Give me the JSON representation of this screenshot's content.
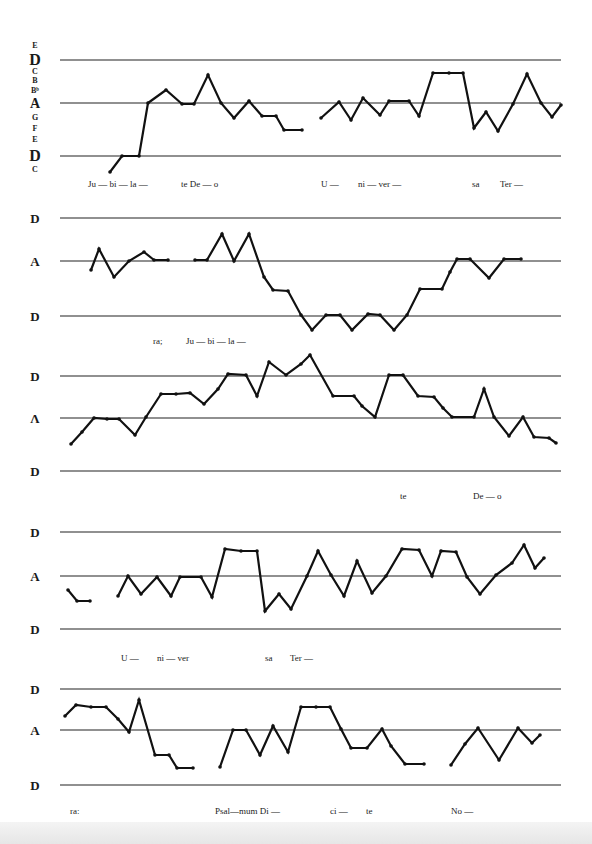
{
  "chart_data": {
    "type": "line",
    "title": "",
    "pitch_scale_labels": [
      "E",
      "D",
      "C",
      "B",
      "B♭",
      "A",
      "G",
      "F",
      "E",
      "D",
      "C"
    ],
    "ylabel_ticks": [
      "D",
      "A",
      "D"
    ],
    "systems": [
      {
        "lines_y": [
          60,
          103,
          156
        ],
        "labels": [
          {
            "text": "E",
            "x": 35,
            "y": 48,
            "size": 8
          },
          {
            "text": "D",
            "x": 35,
            "y": 65,
            "size": 16
          },
          {
            "text": "C",
            "x": 35,
            "y": 74,
            "size": 8
          },
          {
            "text": "B",
            "x": 35,
            "y": 83,
            "size": 8
          },
          {
            "text": "Bᵇ",
            "x": 35,
            "y": 93,
            "size": 8
          },
          {
            "text": "A",
            "x": 35,
            "y": 108,
            "size": 14
          },
          {
            "text": "G",
            "x": 35,
            "y": 120,
            "size": 8
          },
          {
            "text": "F",
            "x": 35,
            "y": 131,
            "size": 8
          },
          {
            "text": "E",
            "x": 35,
            "y": 142,
            "size": 8
          },
          {
            "text": "D",
            "x": 35,
            "y": 161,
            "size": 16
          },
          {
            "text": "C",
            "x": 35,
            "y": 172,
            "size": 8
          }
        ],
        "segments": [
          [
            [
              110,
              172
            ],
            [
              122,
              156
            ],
            [
              139,
              156
            ],
            [
              148,
              103
            ],
            [
              166,
              90
            ],
            [
              182,
              104
            ],
            [
              194,
              104
            ],
            [
              208,
              75
            ],
            [
              221,
              103
            ],
            [
              234,
              118
            ],
            [
              249,
              101
            ],
            [
              262,
              116
            ],
            [
              276,
              116
            ],
            [
              284,
              130
            ],
            [
              302,
              130
            ]
          ],
          [
            [
              321,
              118
            ],
            [
              339,
              102
            ],
            [
              351,
              120
            ],
            [
              363,
              98
            ],
            [
              380,
              115
            ],
            [
              389,
              101
            ],
            [
              409,
              101
            ],
            [
              419,
              116
            ],
            [
              433,
              73
            ],
            [
              449,
              73
            ],
            [
              463,
              73
            ],
            [
              474,
              128
            ],
            [
              486,
              112
            ],
            [
              498,
              131
            ],
            [
              513,
              104
            ],
            [
              527,
              74
            ],
            [
              541,
              103
            ],
            [
              552,
              117
            ],
            [
              561,
              105
            ]
          ]
        ],
        "lyrics": [
          {
            "text": "Ju — bi — la —",
            "x": 88,
            "y": 187
          },
          {
            "text": "te De —   o",
            "x": 181,
            "y": 187
          },
          {
            "text": "U —",
            "x": 321,
            "y": 187
          },
          {
            "text": "ni — ver —",
            "x": 358,
            "y": 187
          },
          {
            "text": "sa",
            "x": 472,
            "y": 187
          },
          {
            "text": "Ter —",
            "x": 500,
            "y": 187
          }
        ]
      },
      {
        "lines_y": [
          218,
          261,
          316
        ],
        "labels": [
          {
            "text": "D",
            "x": 35,
            "y": 223,
            "size": 13
          },
          {
            "text": "A",
            "x": 35,
            "y": 266,
            "size": 13
          },
          {
            "text": "D",
            "x": 35,
            "y": 321,
            "size": 13
          }
        ],
        "segments": [
          [
            [
              91,
              270
            ],
            [
              99,
              249
            ],
            [
              114,
              277
            ],
            [
              129,
              261
            ],
            [
              144,
              252
            ],
            [
              154,
              260
            ],
            [
              168,
              260
            ]
          ],
          [
            [
              195,
              260
            ],
            [
              207,
              260
            ],
            [
              222,
              234
            ],
            [
              234,
              261
            ],
            [
              249,
              234
            ],
            [
              264,
              277
            ],
            [
              273,
              290
            ],
            [
              288,
              291
            ],
            [
              301,
              315
            ],
            [
              312,
              330
            ],
            [
              326,
              315
            ],
            [
              340,
              315
            ],
            [
              352,
              330
            ],
            [
              368,
              314
            ],
            [
              380,
              315
            ],
            [
              394,
              330
            ],
            [
              407,
              315
            ],
            [
              420,
              289
            ],
            [
              442,
              289
            ],
            [
              450,
              272
            ],
            [
              457,
              259
            ],
            [
              470,
              259
            ],
            [
              489,
              278
            ],
            [
              504,
              259
            ],
            [
              521,
              259
            ]
          ]
        ],
        "lyrics": [
          {
            "text": "ra;",
            "x": 153,
            "y": 344
          },
          {
            "text": "Ju — bi — la —",
            "x": 186,
            "y": 344
          }
        ]
      },
      {
        "lines_y": [
          376,
          418,
          471
        ],
        "labels": [
          {
            "text": "D",
            "x": 35,
            "y": 381,
            "size": 13
          },
          {
            "text": "Λ",
            "x": 35,
            "y": 423,
            "size": 13
          },
          {
            "text": "D",
            "x": 35,
            "y": 476,
            "size": 13
          }
        ],
        "segments": [
          [
            [
              71,
              444
            ],
            [
              82,
              432
            ],
            [
              94,
              418
            ],
            [
              107,
              419
            ],
            [
              119,
              419
            ],
            [
              135,
              435
            ],
            [
              146,
              417
            ],
            [
              161,
              394
            ],
            [
              176,
              394
            ],
            [
              190,
              393
            ],
            [
              204,
              404
            ],
            [
              218,
              389
            ],
            [
              228,
              374
            ],
            [
              246,
              375
            ],
            [
              257,
              396
            ],
            [
              269,
              362
            ],
            [
              286,
              375
            ],
            [
              301,
              364
            ],
            [
              310,
              355
            ],
            [
              333,
              396
            ],
            [
              354,
              396
            ],
            [
              362,
              406
            ],
            [
              375,
              417
            ],
            [
              389,
              375
            ],
            [
              403,
              375
            ],
            [
              418,
              396
            ],
            [
              434,
              397
            ],
            [
              443,
              408
            ],
            [
              452,
              417
            ],
            [
              474,
              417
            ],
            [
              484,
              389
            ],
            [
              494,
              417
            ],
            [
              509,
              436
            ],
            [
              523,
              417
            ],
            [
              534,
              437
            ],
            [
              549,
              438
            ],
            [
              556,
              443
            ]
          ]
        ],
        "lyrics": [
          {
            "text": "te",
            "x": 400,
            "y": 499
          },
          {
            "text": "De —  o",
            "x": 473,
            "y": 499
          }
        ]
      },
      {
        "lines_y": [
          532,
          576,
          629
        ],
        "labels": [
          {
            "text": "D",
            "x": 35,
            "y": 537,
            "size": 13
          },
          {
            "text": "A",
            "x": 35,
            "y": 581,
            "size": 13
          },
          {
            "text": "D",
            "x": 35,
            "y": 634,
            "size": 13
          }
        ],
        "segments": [
          [
            [
              68,
              590
            ],
            [
              77,
              601
            ],
            [
              90,
              601
            ]
          ],
          [
            [
              118,
              596
            ],
            [
              128,
              576
            ],
            [
              141,
              594
            ],
            [
              157,
              577
            ],
            [
              171,
              596
            ],
            [
              180,
              577
            ],
            [
              201,
              577
            ],
            [
              212,
              597
            ],
            [
              225,
              549
            ],
            [
              241,
              551
            ],
            [
              257,
              551
            ],
            [
              265,
              611
            ],
            [
              279,
              594
            ],
            [
              291,
              609
            ],
            [
              307,
              576
            ],
            [
              318,
              551
            ],
            [
              331,
              575
            ],
            [
              344,
              596
            ],
            [
              357,
              561
            ],
            [
              372,
              593
            ],
            [
              386,
              576
            ],
            [
              402,
              549
            ],
            [
              419,
              550
            ],
            [
              432,
              576
            ],
            [
              441,
              551
            ],
            [
              456,
              552
            ],
            [
              467,
              577
            ],
            [
              480,
              594
            ],
            [
              496,
              575
            ],
            [
              512,
              563
            ],
            [
              524,
              545
            ],
            [
              535,
              568
            ],
            [
              544,
              558
            ]
          ]
        ],
        "lyrics": [
          {
            "text": "U —",
            "x": 121,
            "y": 661
          },
          {
            "text": "ni — ver",
            "x": 157,
            "y": 661
          },
          {
            "text": "sa",
            "x": 265,
            "y": 661
          },
          {
            "text": "Ter —",
            "x": 290,
            "y": 661
          }
        ]
      },
      {
        "lines_y": [
          689,
          730,
          785
        ],
        "labels": [
          {
            "text": "D",
            "x": 35,
            "y": 694,
            "size": 13
          },
          {
            "text": "A",
            "x": 35,
            "y": 735,
            "size": 13
          },
          {
            "text": "D",
            "x": 35,
            "y": 790,
            "size": 13
          }
        ],
        "segments": [
          [
            [
              65,
              716
            ],
            [
              76,
              705
            ],
            [
              91,
              707
            ],
            [
              106,
              707
            ],
            [
              118,
              719
            ],
            [
              129,
              732
            ],
            [
              139,
              700
            ],
            [
              155,
              755
            ],
            [
              169,
              755
            ],
            [
              177,
              768
            ],
            [
              193,
              768
            ]
          ],
          [
            [
              220,
              767
            ],
            [
              233,
              730
            ],
            [
              246,
              730
            ],
            [
              260,
              755
            ],
            [
              273,
              726
            ],
            [
              288,
              752
            ],
            [
              301,
              707
            ],
            [
              316,
              707
            ],
            [
              330,
              707
            ],
            [
              341,
              729
            ],
            [
              351,
              748
            ],
            [
              367,
              748
            ],
            [
              382,
              729
            ],
            [
              391,
              746
            ],
            [
              405,
              764
            ],
            [
              424,
              764
            ]
          ],
          [
            [
              451,
              765
            ],
            [
              465,
              744
            ],
            [
              478,
              728
            ],
            [
              499,
              760
            ],
            [
              518,
              728
            ],
            [
              532,
              743
            ],
            [
              540,
              735
            ]
          ]
        ],
        "lyrics": [
          {
            "text": "ra:",
            "x": 70,
            "y": 814
          },
          {
            "text": "Psal—mum  Di —",
            "x": 215,
            "y": 814
          },
          {
            "text": "ci —",
            "x": 330,
            "y": 814
          },
          {
            "text": "te",
            "x": 366,
            "y": 814
          },
          {
            "text": "No —",
            "x": 451,
            "y": 814
          }
        ]
      }
    ],
    "staff_x_range": [
      60,
      561
    ],
    "legend": null,
    "grid": false
  }
}
